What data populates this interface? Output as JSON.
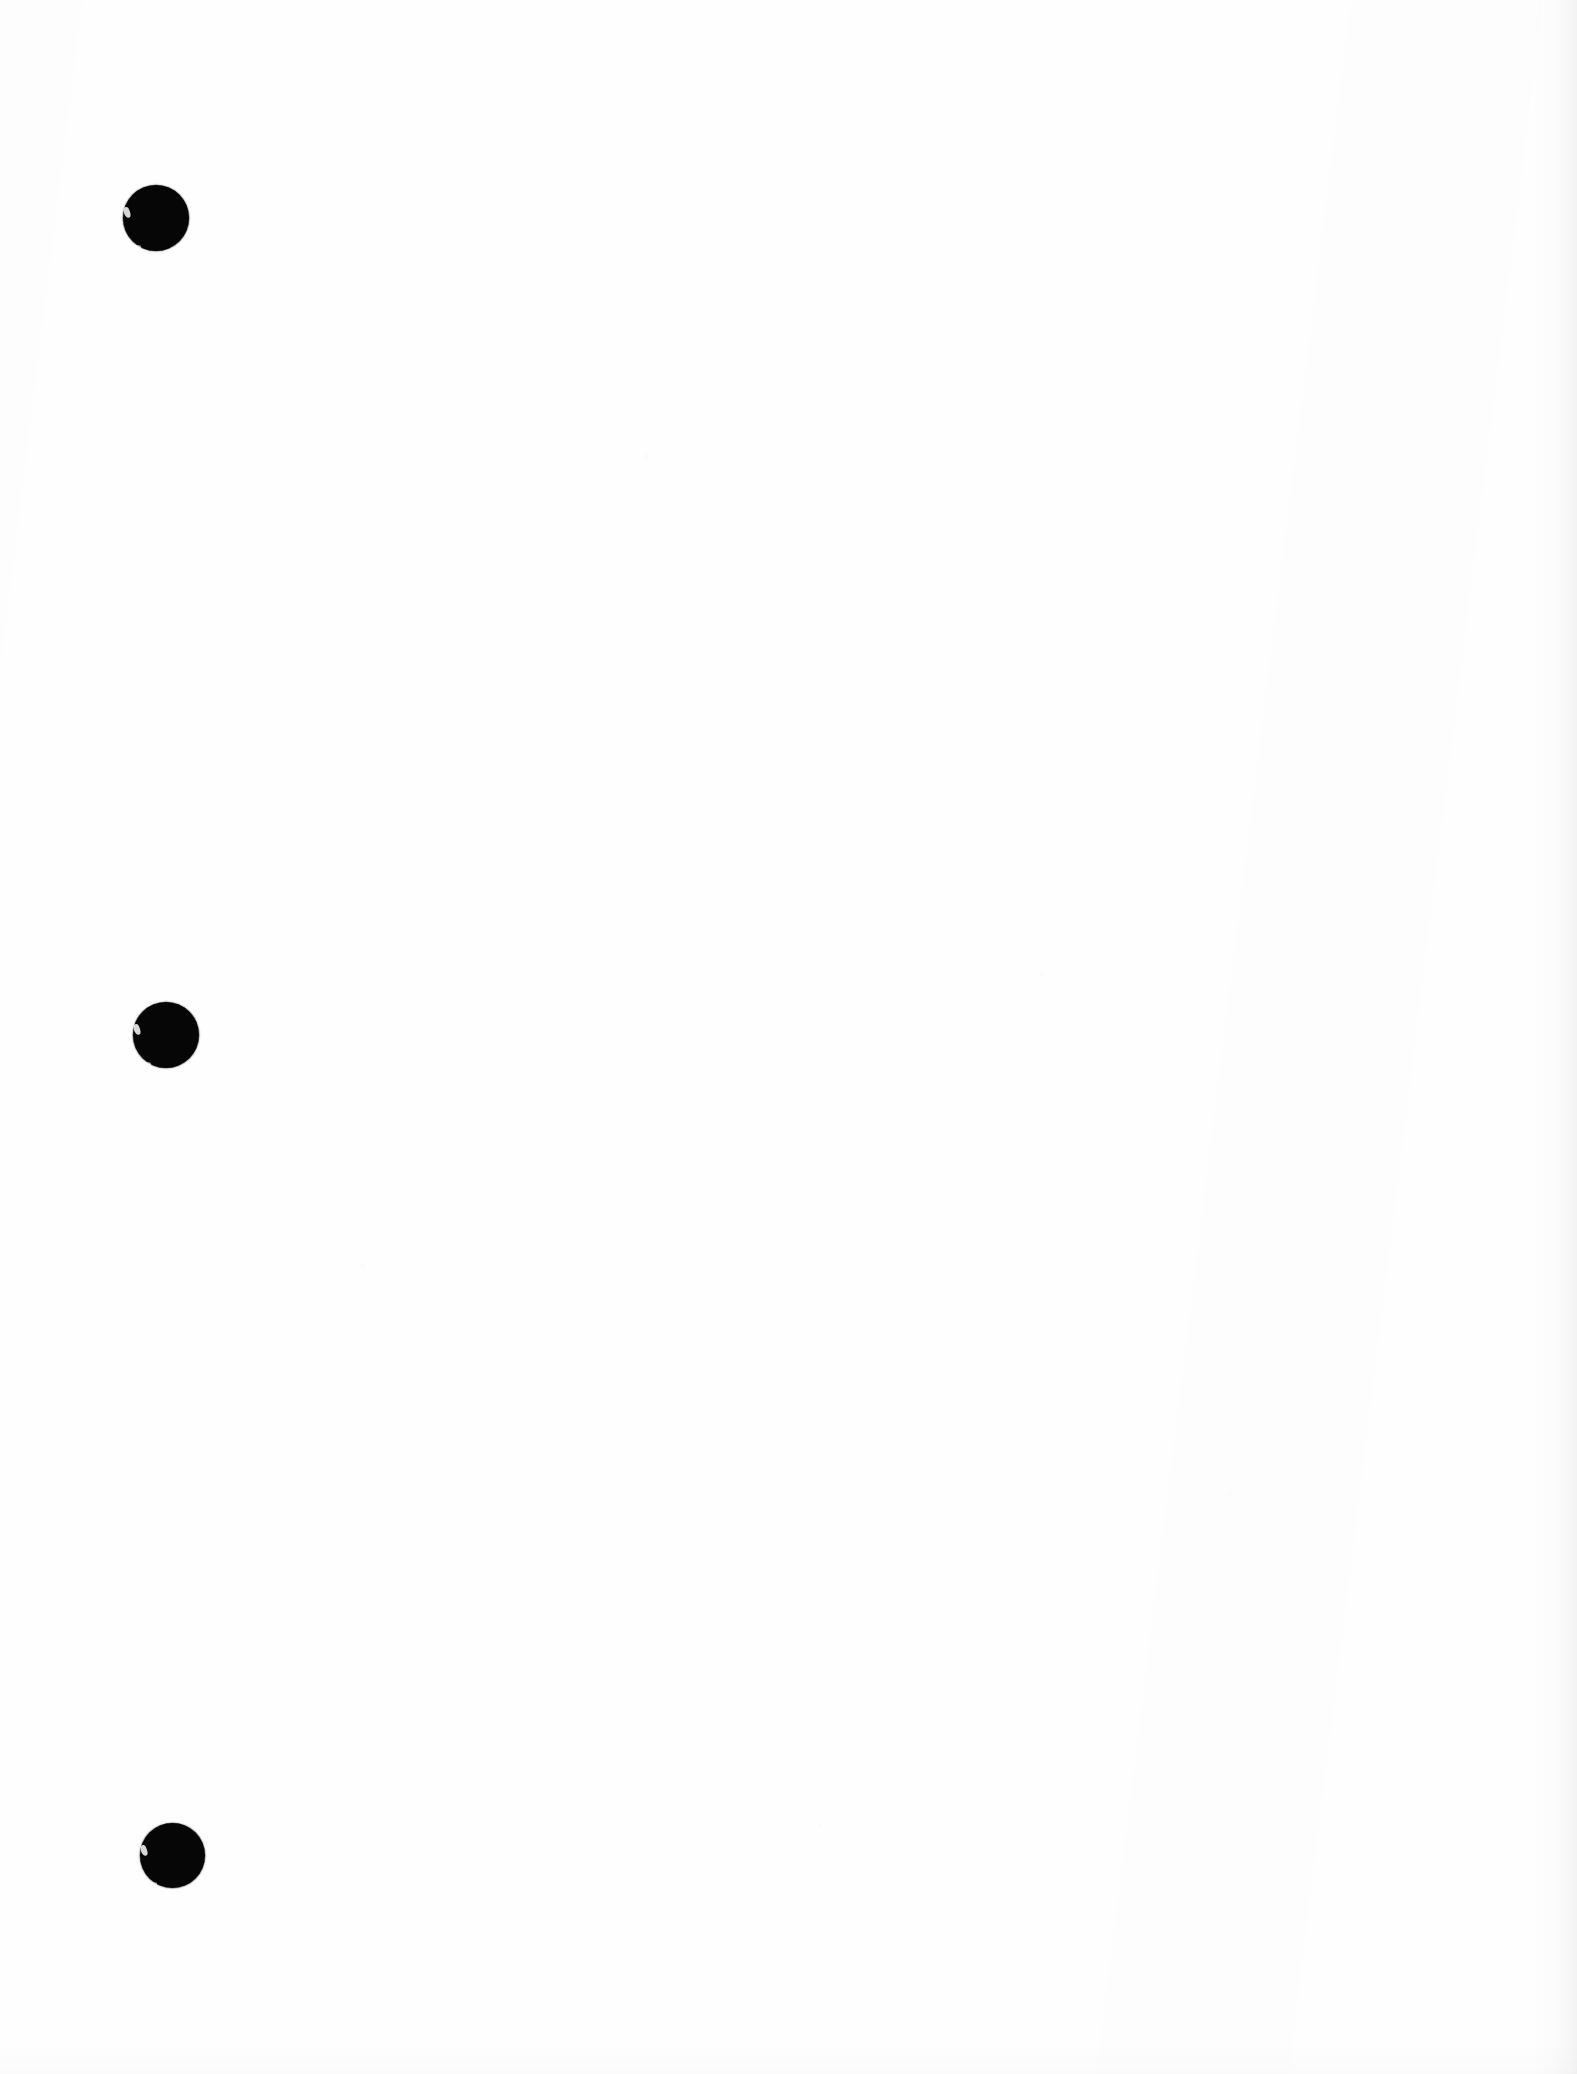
{
  "document": {
    "kind": "scanned-page",
    "page_background_color": "#fefefe",
    "ink_color": "#060606",
    "visible_text": "",
    "note": ""
  },
  "bullets": [
    {
      "index": "1",
      "icon": "filled-circle-bullet-icon",
      "label": "",
      "center_x": "156",
      "center_y": "218",
      "diameter": "66",
      "color": "#060606"
    },
    {
      "index": "2",
      "icon": "filled-circle-bullet-icon",
      "label": "",
      "center_x": "166",
      "center_y": "1035",
      "diameter": "66",
      "color": "#060606"
    },
    {
      "index": "3",
      "icon": "filled-circle-bullet-icon",
      "label": "",
      "center_x": "172",
      "center_y": "1855",
      "diameter": "65",
      "color": "#060606"
    }
  ]
}
